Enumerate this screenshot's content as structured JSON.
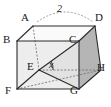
{
  "figure": {
    "kind": "cube-diagram",
    "background_color": "#ffffff",
    "stroke_color": "#2b2b2b",
    "dashed_color": "#555555",
    "face_colors": {
      "top": "#fafafa",
      "front_left": "#eeeeee",
      "front_right": "#e4e4e4",
      "side_right": "#b9b9b9",
      "bottom": "#d6d6d6",
      "bottom_wedge": "#c9c9c9"
    },
    "vertices": [
      {
        "name": "A",
        "label": "A",
        "x": 33,
        "y": 26,
        "label_x": 21,
        "label_y": 14
      },
      {
        "name": "B",
        "label": "B",
        "x": 17,
        "y": 41,
        "label_x": 4,
        "label_y": 35
      },
      {
        "name": "C",
        "label": "C",
        "x": 79,
        "y": 41,
        "label_x": 70,
        "label_y": 35
      },
      {
        "name": "D",
        "label": "D",
        "x": 95,
        "y": 26,
        "label_x": 96,
        "label_y": 14
      },
      {
        "name": "E",
        "label": "E",
        "x": 39,
        "y": 70,
        "label_x": 27,
        "label_y": 62
      },
      {
        "name": "F",
        "label": "F",
        "x": 17,
        "y": 89,
        "label_x": 6,
        "label_y": 87
      },
      {
        "name": "G",
        "label": "G",
        "x": 79,
        "y": 89,
        "label_x": 71,
        "label_y": 87
      },
      {
        "name": "H",
        "label": "H",
        "x": 101,
        "y": 70,
        "label_x": 98,
        "label_y": 64
      }
    ],
    "measures": [
      {
        "name": "edge-length",
        "label": "2",
        "label_x": 58,
        "label_y": 9,
        "arc_from_x": 37,
        "arc_from_y": 22,
        "arc_to_x": 93,
        "arc_to_y": 22,
        "arc_peak_x": 65,
        "arc_peak_y": 6
      },
      {
        "name": "angle-x",
        "label": "x",
        "label_x": 50,
        "label_y": 63
      }
    ],
    "solid_edges": [
      "A-B",
      "A-D",
      "B-C",
      "C-D",
      "B-F",
      "C-G",
      "D-H",
      "F-G",
      "G-H",
      "E-C",
      "E-F",
      "E-G"
    ],
    "dashed_edges": [
      "A-E",
      "E-H",
      "F-H",
      "B-H"
    ]
  }
}
